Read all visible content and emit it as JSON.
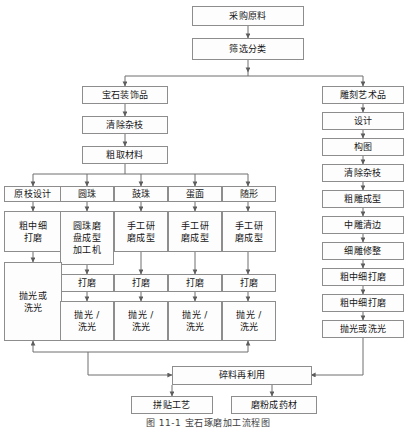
{
  "figure": {
    "caption": "图 11-1  宝石琢磨加工流程图",
    "kind": "flowchart",
    "title": "宝石琢磨加工流程图"
  },
  "style": {
    "box_border": "#8d8d8d",
    "box_fill": "#fdfdfd",
    "line": "#6e6e6e",
    "text": "#161616"
  },
  "nodes": {
    "purchase": "采购原料",
    "screen": "筛选分类",
    "gem_decor": "宝石装饰品",
    "carve_art": "雕刻艺术品",
    "clean_branch_left": "清除杂枝",
    "rough_material": "粗取材料",
    "design_right": "设计",
    "composition": "构图",
    "clean_branch_right": "清除杂枝",
    "rough_carve": "粗雕成型",
    "mid_carve": "中雕清边",
    "fine_carve": "细雕修整",
    "grind_right": "粗中细打磨",
    "polish_right": "抛光或洗光",
    "col1_head": "原枝设计",
    "col2_head": "圆珠",
    "col3_head": "鼓珠",
    "col4_head": "蛋面",
    "col5_head": "随形",
    "col1_mid": "粗中细\n打磨",
    "col2_mid": "圆珠磨\n盘成型\n加工机",
    "col3_mid": "手工研\n磨成型",
    "col4_mid": "手工研\n磨成型",
    "col5_mid": "手工研\n磨成型",
    "col2_grind": "打磨",
    "col3_grind": "打磨",
    "col4_grind": "打磨",
    "col5_grind": "打磨",
    "col1_polish": "抛光或\n洗光",
    "col2_polish": "抛光 /\n洗光",
    "col3_polish": "抛光 /\n洗光",
    "col4_polish": "抛光 /\n洗光",
    "col5_polish": "抛光 /\n洗光",
    "scrap_reuse": "碎料再利用",
    "mosaic": "拼贴工艺",
    "powder": "磨粉成药材"
  }
}
